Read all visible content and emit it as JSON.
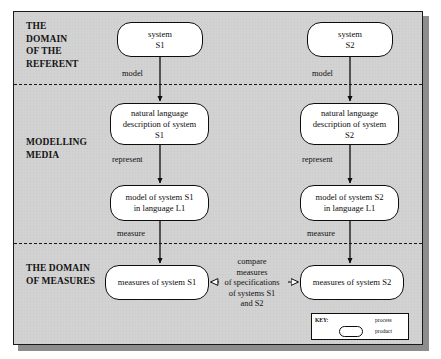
{
  "diagram": {
    "bands": [
      {
        "id": "referent",
        "label": "THE\nDOMAIN\nOF THE\nREFERENT"
      },
      {
        "id": "modelling",
        "label": "MODELLING\nMEDIA"
      },
      {
        "id": "measures",
        "label": "THE DOMAIN\nOF MEASURES"
      }
    ],
    "nodes": [
      {
        "id": "system-s1",
        "label": "system\nS1"
      },
      {
        "id": "system-s2",
        "label": "system\nS2"
      },
      {
        "id": "nl-s1",
        "label": "natural language\ndescription of system\nS1"
      },
      {
        "id": "nl-s2",
        "label": "natural language\ndescription of system\nS2"
      },
      {
        "id": "model-s1",
        "label": "model of system S1\nin language L1"
      },
      {
        "id": "model-s2",
        "label": "model of system S2\nin language L1"
      },
      {
        "id": "meas-s1",
        "label": "measures of system S1"
      },
      {
        "id": "meas-s2",
        "label": "measures of system S2"
      }
    ],
    "edges": [
      {
        "id": "model-1",
        "label": "model"
      },
      {
        "id": "model-2",
        "label": "model"
      },
      {
        "id": "represent-1",
        "label": "represent"
      },
      {
        "id": "represent-2",
        "label": "represent"
      },
      {
        "id": "measure-1",
        "label": "measure"
      },
      {
        "id": "measure-2",
        "label": "measure"
      }
    ],
    "compare_annotation": "compare\nmeasures\nof specifications\nof systems  S1\nand  S2",
    "key": {
      "title": "KEY:",
      "process_label": "process",
      "product_label": "product"
    },
    "colors": {
      "panel_background": "#d2d2d2",
      "node_fill": "#ffffff",
      "stroke": "#0d0d0d",
      "shadow": "#8d8d8d"
    }
  }
}
